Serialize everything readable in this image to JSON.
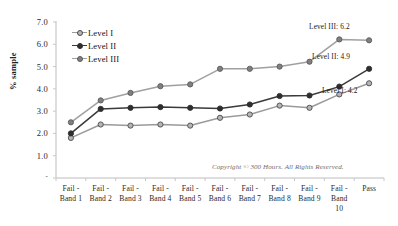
{
  "chart_data": {
    "type": "line",
    "title": "",
    "xlabel": "",
    "ylabel": "% sample",
    "ylim": [
      0,
      7
    ],
    "yticks": [
      "-",
      "1.0",
      "2.0",
      "3.0",
      "4.0",
      "5.0",
      "6.0",
      "7.0"
    ],
    "grid": false,
    "legend_position": "upper-left-inside",
    "categories": [
      "Fail - Band 1",
      "Fail - Band 2",
      "Fail - Band 3",
      "Fail - Band 4",
      "Fail - Band 5",
      "Fail - Band 6",
      "Fail - Band 7",
      "Fail - Band 8",
      "Fail - Band 9",
      "Fail - Band 10",
      "Pass"
    ],
    "category_lines": [
      [
        "Fail -",
        "Band 1"
      ],
      [
        "Fail -",
        "Band 2"
      ],
      [
        "Fail -",
        "Band 3"
      ],
      [
        "Fail -",
        "Band 4"
      ],
      [
        "Fail -",
        "Band 5"
      ],
      [
        "Fail -",
        "Band 6"
      ],
      [
        "Fail -",
        "Band 7"
      ],
      [
        "Fail -",
        "Band 8"
      ],
      [
        "Fail -",
        "Band 9"
      ],
      [
        "Fail -",
        "Band",
        "10"
      ],
      [
        "Pass"
      ]
    ],
    "series": [
      {
        "name": "Level I",
        "color": "#9a9a9a",
        "marker_fill": "#b5b5b5",
        "marker_stroke": "#4a4a4a",
        "values": [
          1.8,
          2.4,
          2.35,
          2.4,
          2.35,
          2.7,
          2.85,
          3.25,
          3.15,
          3.75,
          4.25
        ]
      },
      {
        "name": "Level II",
        "color": "#3a3a3a",
        "marker_fill": "#2e2e2e",
        "marker_stroke": "#2e2e2e",
        "values": [
          2.0,
          3.1,
          3.15,
          3.18,
          3.15,
          3.12,
          3.3,
          3.68,
          3.7,
          4.1,
          4.9
        ]
      },
      {
        "name": "Level III",
        "color": "#a0a0a0",
        "marker_fill": "#808080",
        "marker_stroke": "#5a5a5a",
        "values": [
          2.5,
          3.48,
          3.82,
          4.12,
          4.2,
          4.9,
          4.9,
          5.0,
          5.22,
          6.22,
          6.18
        ]
      }
    ],
    "annotations": [
      {
        "text": "Level III: 6.2",
        "series": "Level III",
        "value": 6.2
      },
      {
        "text": "Level II: 4.9",
        "series": "Level II",
        "value": 4.9
      },
      {
        "text": "Level I: 4.2",
        "series": "Level I",
        "value": 4.2
      }
    ],
    "footnote": "Copyright © 300 Hours. All Rights Reserved."
  },
  "axis": {
    "y_title": "% sample",
    "tick_color": "#c8c8c8",
    "axis_color": "#bdbdbd"
  },
  "legend": {
    "items": [
      {
        "label": "Level I"
      },
      {
        "label": "Level II"
      },
      {
        "label": "Level III"
      }
    ]
  },
  "annotations": {
    "level3": "Level III: 6.2",
    "level2": "Level II: 4.9",
    "level1": "Level I: 4.2"
  },
  "footnote": {
    "text": "Copyright © 300 Hours. All Rights Reserved."
  }
}
